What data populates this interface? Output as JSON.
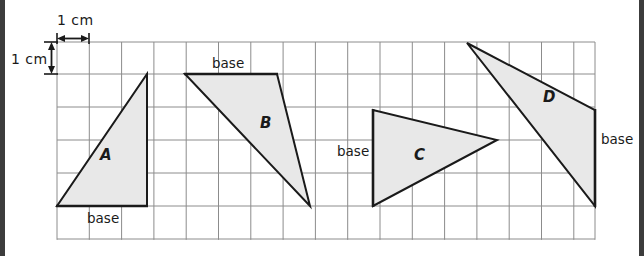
{
  "figure": {
    "type": "geometry-worksheet-grid",
    "grid": {
      "origin_x": 57,
      "origin_y": 42,
      "cell_size": 32.3,
      "columns": 17,
      "rows": 6,
      "line_color": "#8c8c8c",
      "background_color": "#ffffff"
    },
    "style": {
      "shape_fill": "#e8e8e8",
      "shape_stroke": "#1a1a1a",
      "edge_bar_color": "#3c3c3c",
      "text_color": "#1a1a1a"
    },
    "scale_labels": {
      "horizontal": "1 cm",
      "vertical": "1 cm"
    },
    "base_labels": {
      "a": "base",
      "b": "base",
      "c": "base",
      "d": "base"
    },
    "shape_labels": {
      "a": "A",
      "b": "B",
      "c": "C",
      "d": "D"
    },
    "shapes": [
      {
        "name": "A",
        "points": "57,206 147,206 147,74",
        "base_edge": "bottom-horizontal",
        "base_length_cm": 3,
        "height_cm": 4
      },
      {
        "name": "B",
        "points": "185,74 277,74 310,206",
        "base_edge": "top-horizontal",
        "base_length_cm": 3,
        "height_cm": 4
      },
      {
        "name": "C",
        "points": "373,110 373,206 497,140",
        "base_edge": "left-vertical",
        "base_length_cm": 3,
        "height_cm": 4
      },
      {
        "name": "D",
        "points": "467,43 595,110 595,206",
        "base_edge": "right-vertical",
        "base_length_cm": 3,
        "height_cm": 4
      }
    ]
  }
}
